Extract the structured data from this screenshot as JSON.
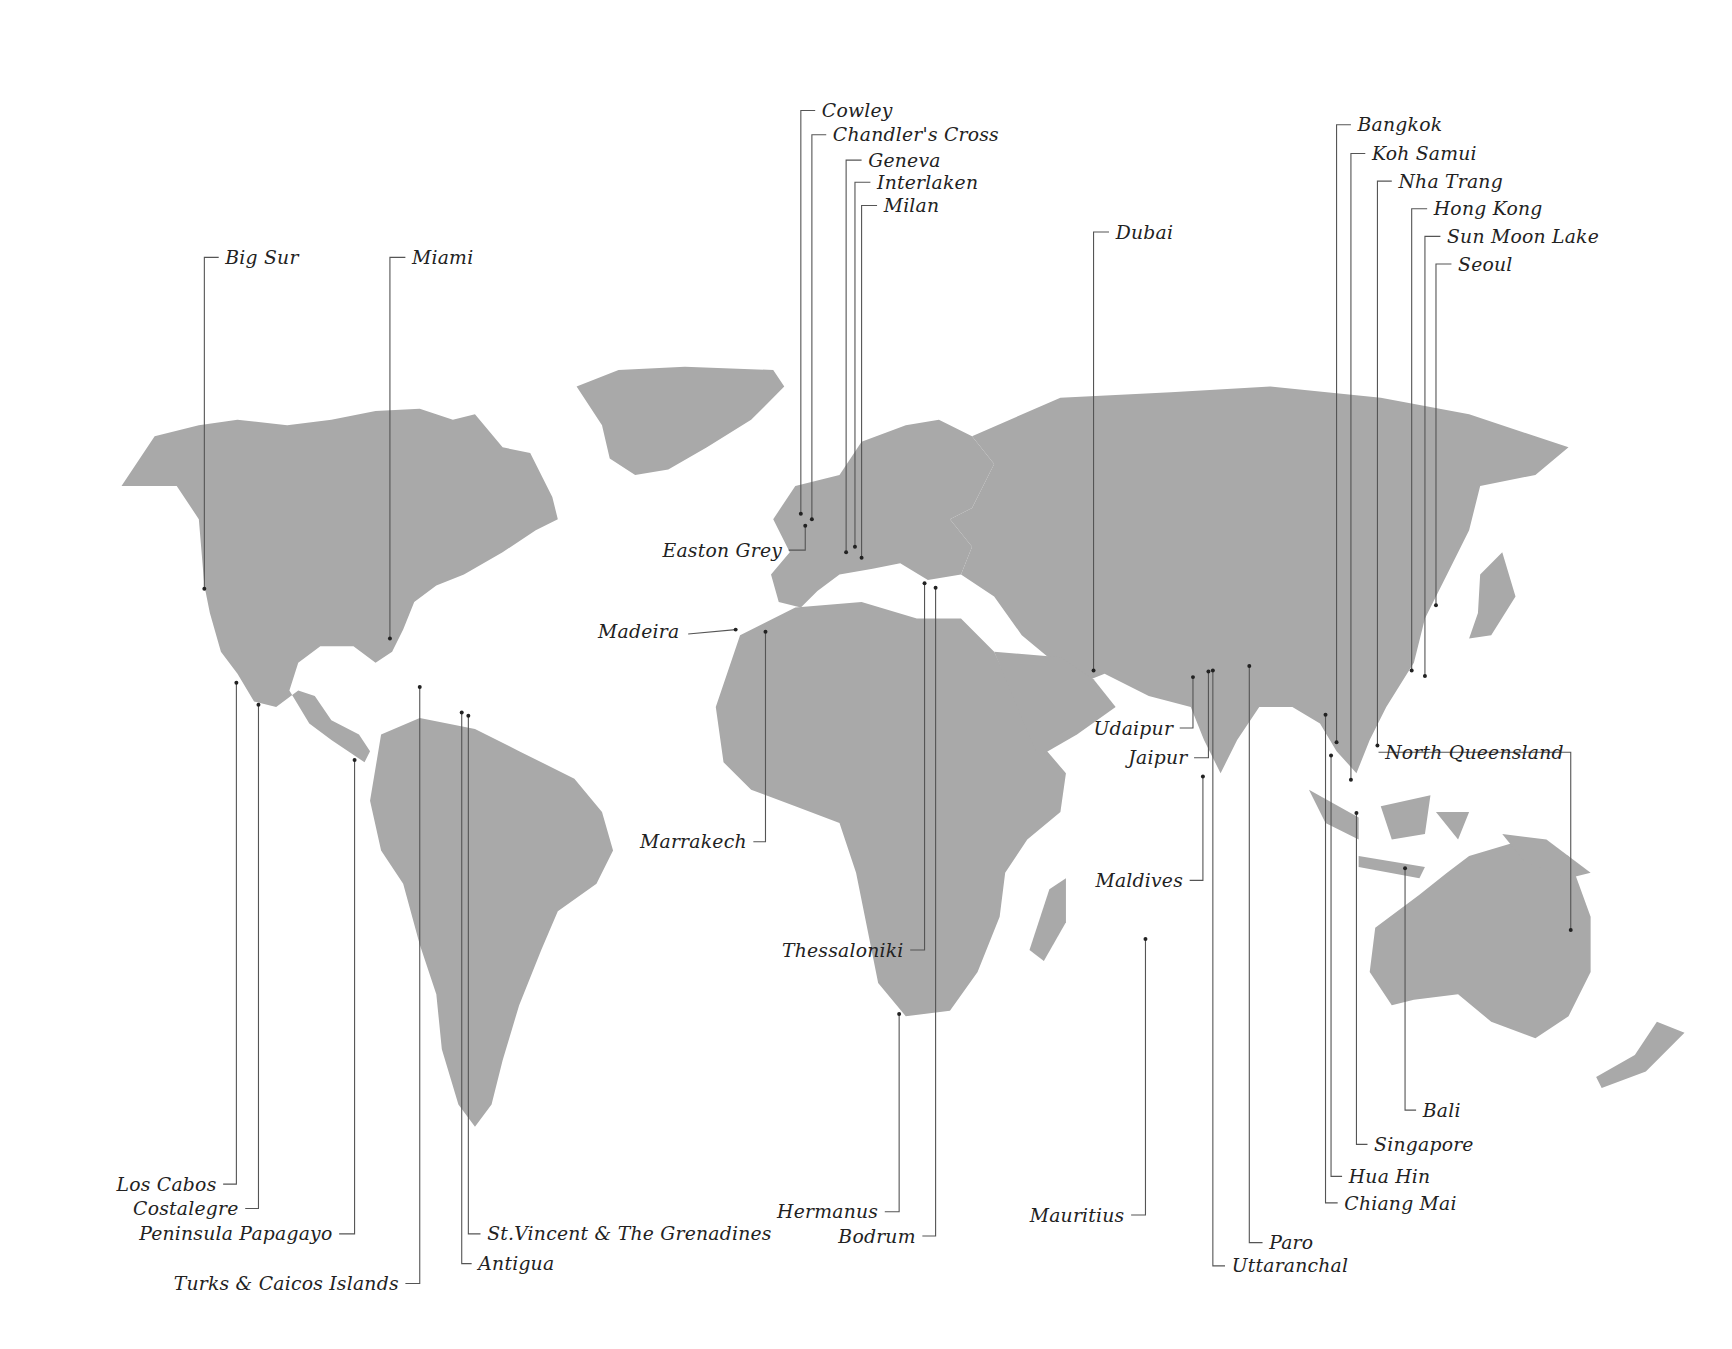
{
  "map": {
    "title": "",
    "land_color": "#a9a9a9",
    "line_color": "#555555",
    "label_color": "#222222",
    "locations": [
      {
        "name": "Big Sur",
        "label_x": 204,
        "label_y": 233,
        "anchor": "left",
        "dot": [
          185,
          533
        ],
        "elbow": [
          185,
          233
        ]
      },
      {
        "name": "Miami",
        "label_x": 373,
        "label_y": 233,
        "anchor": "left",
        "dot": [
          353,
          578
        ],
        "elbow": [
          353,
          233
        ]
      },
      {
        "name": "Cowley",
        "label_x": 744,
        "label_y": 100,
        "anchor": "left",
        "dot": [
          725,
          465
        ],
        "elbow": [
          725,
          100
        ]
      },
      {
        "name": "Chandler's Cross",
        "label_x": 754,
        "label_y": 122,
        "anchor": "left",
        "dot": [
          735,
          470
        ],
        "elbow": [
          735,
          122
        ]
      },
      {
        "name": "Geneva",
        "label_x": 786,
        "label_y": 145,
        "anchor": "left",
        "dot": [
          766,
          500
        ],
        "elbow": [
          766,
          145
        ]
      },
      {
        "name": "Interlaken",
        "label_x": 794,
        "label_y": 165,
        "anchor": "left",
        "dot": [
          774,
          495
        ],
        "elbow": [
          774,
          165
        ]
      },
      {
        "name": "Milan",
        "label_x": 800,
        "label_y": 186,
        "anchor": "left",
        "dot": [
          780,
          505
        ],
        "elbow": [
          780,
          186
        ]
      },
      {
        "name": "Dubai",
        "label_x": 1010,
        "label_y": 210,
        "anchor": "left",
        "dot": [
          990,
          607
        ],
        "elbow": [
          990,
          210
        ]
      },
      {
        "name": "Bangkok",
        "label_x": 1229,
        "label_y": 113,
        "anchor": "left",
        "dot": [
          1210,
          672
        ],
        "elbow": [
          1210,
          113
        ]
      },
      {
        "name": "Koh Samui",
        "label_x": 1242,
        "label_y": 139,
        "anchor": "left",
        "dot": [
          1223,
          706
        ],
        "elbow": [
          1223,
          139
        ]
      },
      {
        "name": "Nha Trang",
        "label_x": 1266,
        "label_y": 164,
        "anchor": "left",
        "dot": [
          1247,
          675
        ],
        "elbow": [
          1247,
          164
        ]
      },
      {
        "name": "Hong Kong",
        "label_x": 1298,
        "label_y": 189,
        "anchor": "left",
        "dot": [
          1278,
          607
        ],
        "elbow": [
          1278,
          189
        ]
      },
      {
        "name": "Sun Moon Lake",
        "label_x": 1310,
        "label_y": 214,
        "anchor": "left",
        "dot": [
          1290,
          612
        ],
        "elbow": [
          1290,
          214
        ]
      },
      {
        "name": "Seoul",
        "label_x": 1320,
        "label_y": 239,
        "anchor": "left",
        "dot": [
          1300,
          548
        ],
        "elbow": [
          1300,
          239
        ]
      },
      {
        "name": "Easton Grey",
        "label_x": 708,
        "label_y": 498,
        "anchor": "right",
        "dot": [
          729,
          476
        ],
        "elbow": [
          729,
          498
        ]
      },
      {
        "name": "Madeira",
        "label_x": 615,
        "label_y": 572,
        "anchor": "right",
        "dot": [
          666,
          570
        ],
        "elbow": null
      },
      {
        "name": "Marrakech",
        "label_x": 676,
        "label_y": 762,
        "anchor": "right",
        "dot": [
          693,
          572
        ],
        "elbow": [
          693,
          762
        ]
      },
      {
        "name": "Thessaloniki",
        "label_x": 818,
        "label_y": 860,
        "anchor": "right",
        "dot": [
          837,
          528
        ],
        "elbow": [
          837,
          860
        ]
      },
      {
        "name": "Udaipur",
        "label_x": 1062,
        "label_y": 659,
        "anchor": "right",
        "dot": [
          1080,
          613
        ],
        "elbow": [
          1080,
          659
        ]
      },
      {
        "name": "Jaipur",
        "label_x": 1075,
        "label_y": 686,
        "anchor": "right",
        "dot": [
          1094,
          608
        ],
        "elbow": [
          1094,
          686
        ]
      },
      {
        "name": "Maldives",
        "label_x": 1071,
        "label_y": 797,
        "anchor": "right",
        "dot": [
          1089,
          703
        ],
        "elbow": [
          1089,
          797
        ]
      },
      {
        "name": "North Queensland",
        "label_x": 1254,
        "label_y": 681,
        "anchor": "left",
        "dot": [
          1422,
          842
        ],
        "elbow": [
          1422,
          681
        ],
        "label_side": "left-of-line"
      },
      {
        "name": "Los Cabos",
        "label_x": 196,
        "label_y": 1072,
        "anchor": "right",
        "dot": [
          214,
          618
        ],
        "elbow": [
          214,
          1072
        ]
      },
      {
        "name": "Costalegre",
        "label_x": 216,
        "label_y": 1094,
        "anchor": "right",
        "dot": [
          234,
          638
        ],
        "elbow": [
          234,
          1094
        ]
      },
      {
        "name": "Peninsula Papagayo",
        "label_x": 301,
        "label_y": 1117,
        "anchor": "right",
        "dot": [
          321,
          688
        ],
        "elbow": [
          321,
          1117
        ]
      },
      {
        "name": "Turks & Caicos Islands",
        "label_x": 361,
        "label_y": 1162,
        "anchor": "right",
        "dot": [
          380,
          622
        ],
        "elbow": [
          380,
          1162
        ]
      },
      {
        "name": "St.Vincent & The Grenadines",
        "label_x": 441,
        "label_y": 1117,
        "anchor": "left",
        "dot": [
          424,
          648
        ],
        "elbow": [
          424,
          1117
        ]
      },
      {
        "name": "Antigua",
        "label_x": 433,
        "label_y": 1144,
        "anchor": "left",
        "dot": [
          418,
          645
        ],
        "elbow": [
          418,
          1144
        ]
      },
      {
        "name": "Hermanus",
        "label_x": 795,
        "label_y": 1097,
        "anchor": "right",
        "dot": [
          814,
          918
        ],
        "elbow": [
          814,
          1097
        ]
      },
      {
        "name": "Bodrum",
        "label_x": 829,
        "label_y": 1119,
        "anchor": "right",
        "dot": [
          847,
          532
        ],
        "elbow": [
          847,
          1119
        ]
      },
      {
        "name": "Mauritius",
        "label_x": 1018,
        "label_y": 1100,
        "anchor": "right",
        "dot": [
          1037,
          850
        ],
        "elbow": [
          1037,
          1100
        ]
      },
      {
        "name": "Paro",
        "label_x": 1149,
        "label_y": 1125,
        "anchor": "left",
        "dot": [
          1131,
          603
        ],
        "elbow": [
          1131,
          1125
        ]
      },
      {
        "name": "Uttaranchal",
        "label_x": 1115,
        "label_y": 1146,
        "anchor": "left",
        "dot": [
          1098,
          607
        ],
        "elbow": [
          1098,
          1146
        ]
      },
      {
        "name": "Bali",
        "label_x": 1288,
        "label_y": 1005,
        "anchor": "left",
        "dot": [
          1272,
          786
        ],
        "elbow": [
          1272,
          1005
        ]
      },
      {
        "name": "Singapore",
        "label_x": 1244,
        "label_y": 1036,
        "anchor": "left",
        "dot": [
          1228,
          736
        ],
        "elbow": [
          1228,
          1036
        ]
      },
      {
        "name": "Hua Hin",
        "label_x": 1221,
        "label_y": 1065,
        "anchor": "left",
        "dot": [
          1205,
          684
        ],
        "elbow": [
          1205,
          1065
        ]
      },
      {
        "name": "Chiang Mai",
        "label_x": 1217,
        "label_y": 1089,
        "anchor": "left",
        "dot": [
          1200,
          647
        ],
        "elbow": [
          1200,
          1089
        ]
      }
    ]
  }
}
